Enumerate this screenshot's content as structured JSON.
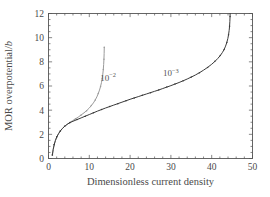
{
  "chart_data": {
    "type": "line",
    "title": "",
    "subtitle": "",
    "xlabel": "Dimensionless current density",
    "ylabel": "MOR overpotential/b",
    "ylabel_parts": {
      "main": "MOR overpotential/",
      "italic": "b"
    },
    "xlim": [
      0,
      50
    ],
    "ylim": [
      0,
      12
    ],
    "xticks": [
      0,
      10,
      20,
      30,
      40,
      50
    ],
    "yticks": [
      0,
      2,
      4,
      6,
      8,
      10,
      12
    ],
    "xtick_labels": [
      "0",
      "10",
      "20",
      "30",
      "40",
      "50"
    ],
    "ytick_labels": [
      "0",
      "2",
      "4",
      "6",
      "8",
      "10",
      "12"
    ],
    "x_minor_step": 2,
    "y_minor_step": 0.5,
    "grid": false,
    "legend": "none",
    "tick_direction": "in",
    "box": true,
    "marker": "dot",
    "annotations": [
      {
        "name": "curve-label-1e-2",
        "base": "10",
        "exponent": "−2",
        "x": 14.6,
        "y": 6.45
      },
      {
        "name": "curve-label-1e-3",
        "base": "10",
        "exponent": "−3",
        "x": 30.0,
        "y": 6.82
      }
    ],
    "series": [
      {
        "name": "10^-2",
        "label": "10−2",
        "color": "#9a9a9a",
        "limiting_current": 13.7,
        "points": [
          [
            0.95,
            0.3
          ],
          [
            1.15,
            0.75
          ],
          [
            1.4,
            1.15
          ],
          [
            1.7,
            1.5
          ],
          [
            2.05,
            1.8
          ],
          [
            2.45,
            2.05
          ],
          [
            2.9,
            2.28
          ],
          [
            3.4,
            2.48
          ],
          [
            3.95,
            2.66
          ],
          [
            4.55,
            2.82
          ],
          [
            5.2,
            2.98
          ],
          [
            5.9,
            3.13
          ],
          [
            6.6,
            3.28
          ],
          [
            7.3,
            3.43
          ],
          [
            8.0,
            3.6
          ],
          [
            8.7,
            3.78
          ],
          [
            9.35,
            3.96
          ],
          [
            9.95,
            4.16
          ],
          [
            10.5,
            4.38
          ],
          [
            11.0,
            4.6
          ],
          [
            11.45,
            4.84
          ],
          [
            11.85,
            5.1
          ],
          [
            12.2,
            5.38
          ],
          [
            12.5,
            5.66
          ],
          [
            12.76,
            5.96
          ],
          [
            12.98,
            6.28
          ],
          [
            13.16,
            6.62
          ],
          [
            13.31,
            6.98
          ],
          [
            13.43,
            7.36
          ],
          [
            13.52,
            7.78
          ],
          [
            13.59,
            8.22
          ],
          [
            13.64,
            8.7
          ],
          [
            13.67,
            9.2
          ]
        ]
      },
      {
        "name": "10^-3",
        "label": "10−3",
        "color": "#3a3a3a",
        "limiting_current": 44.5,
        "points": [
          [
            0.95,
            0.3
          ],
          [
            1.15,
            0.75
          ],
          [
            1.4,
            1.15
          ],
          [
            1.7,
            1.5
          ],
          [
            2.05,
            1.8
          ],
          [
            2.45,
            2.05
          ],
          [
            2.9,
            2.28
          ],
          [
            3.4,
            2.48
          ],
          [
            3.95,
            2.66
          ],
          [
            4.55,
            2.82
          ],
          [
            5.2,
            2.96
          ],
          [
            6.0,
            3.08
          ],
          [
            7.0,
            3.22
          ],
          [
            8.0,
            3.36
          ],
          [
            9.0,
            3.5
          ],
          [
            10.0,
            3.64
          ],
          [
            11.0,
            3.78
          ],
          [
            12.0,
            3.92
          ],
          [
            13.0,
            4.05
          ],
          [
            14.0,
            4.18
          ],
          [
            15.0,
            4.3
          ],
          [
            16.0,
            4.42
          ],
          [
            17.0,
            4.54
          ],
          [
            18.0,
            4.66
          ],
          [
            19.0,
            4.78
          ],
          [
            20.0,
            4.9
          ],
          [
            21.0,
            5.01
          ],
          [
            22.0,
            5.12
          ],
          [
            23.0,
            5.23
          ],
          [
            24.0,
            5.34
          ],
          [
            25.0,
            5.45
          ],
          [
            26.0,
            5.56
          ],
          [
            27.0,
            5.67
          ],
          [
            28.0,
            5.79
          ],
          [
            29.0,
            5.91
          ],
          [
            30.0,
            6.03
          ],
          [
            31.0,
            6.16
          ],
          [
            32.0,
            6.29
          ],
          [
            33.0,
            6.43
          ],
          [
            34.0,
            6.58
          ],
          [
            35.0,
            6.74
          ],
          [
            36.0,
            6.91
          ],
          [
            37.0,
            7.1
          ],
          [
            38.0,
            7.31
          ],
          [
            39.0,
            7.54
          ],
          [
            40.0,
            7.8
          ],
          [
            40.8,
            8.04
          ],
          [
            41.5,
            8.28
          ],
          [
            42.1,
            8.52
          ],
          [
            42.6,
            8.76
          ],
          [
            43.05,
            9.02
          ],
          [
            43.4,
            9.3
          ],
          [
            43.7,
            9.6
          ],
          [
            43.95,
            9.92
          ],
          [
            44.13,
            10.25
          ],
          [
            44.28,
            10.6
          ],
          [
            44.38,
            10.95
          ],
          [
            44.45,
            11.35
          ],
          [
            44.5,
            11.75
          ],
          [
            44.52,
            12.0
          ]
        ]
      }
    ]
  },
  "figure": {
    "background_color": "#ffffff",
    "axis_color": "#555555",
    "text_color": "#4a4a4a"
  }
}
